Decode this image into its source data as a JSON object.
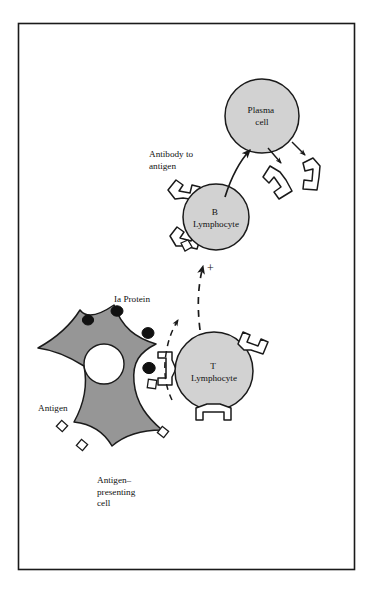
{
  "figure": {
    "border_color": "#1a1a1a",
    "background": "#ffffff"
  },
  "colors": {
    "cell_fill_light": "#d2d2d2",
    "apc_fill": "#969696",
    "nucleus_fill": "#ffffff",
    "outline": "#1a1a1a",
    "ia_protein_fill": "#111111",
    "antibody_fill": "#ffffff",
    "antigen_fill": "#ffffff"
  },
  "cells": {
    "plasma": {
      "label_line1": "Plasma",
      "label_line2": "cell",
      "cx": 262,
      "cy": 116,
      "r": 37
    },
    "b_lymphocyte": {
      "label_line1": "B",
      "label_line2": "Lymphocyte",
      "cx": 216,
      "cy": 217,
      "r": 33
    },
    "t_lymphocyte": {
      "label_line1": "T",
      "label_line2": "Lymphocyte",
      "cx": 214,
      "cy": 371,
      "r": 39
    },
    "antigen_presenting": {
      "label_line1": "Antigen–",
      "label_line2": "presenting",
      "label_line3": "cell"
    }
  },
  "labels": {
    "antibody_to_antigen_line1": "Antibody to",
    "antibody_to_antigen_line2": "antigen",
    "ia_protein": "Ia Protein",
    "antigen": "Antigen",
    "plus_sign": "+"
  },
  "icons": {
    "antibody": "antibody-y-shape-icon",
    "antigen_square": "antigen-square-icon",
    "ia_protein_dot": "ia-protein-dot-icon",
    "activation_arrow": "dashed-activation-arrow-icon",
    "differentiation_arrow": "curved-differentiation-arrow-icon",
    "secretion_arrow": "antibody-secretion-arrow-icon"
  }
}
